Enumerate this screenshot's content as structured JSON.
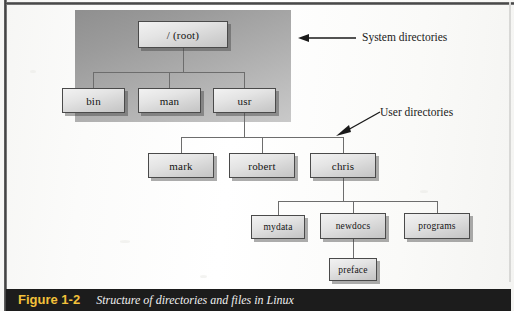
{
  "figure": {
    "number": "Figure 1-2",
    "caption": "Structure of directories and files in Linux"
  },
  "annotations": [
    {
      "id": "system-directories",
      "label": "System directories",
      "x": 362,
      "y": 36
    },
    {
      "id": "user-directories",
      "label": "User directories",
      "x": 380,
      "y": 113
    }
  ],
  "tree": {
    "title": "Structure of directories and files in Linux",
    "nodes": [
      {
        "id": "root",
        "label": "/ (root)",
        "x": 138,
        "y": 21,
        "w": 90,
        "h": 27,
        "level": 0,
        "zone": "system"
      },
      {
        "id": "bin",
        "label": "bin",
        "x": 62,
        "y": 88,
        "w": 63,
        "h": 25,
        "level": 1,
        "zone": "system"
      },
      {
        "id": "man",
        "label": "man",
        "x": 138,
        "y": 88,
        "w": 63,
        "h": 25,
        "level": 1,
        "zone": "system"
      },
      {
        "id": "usr",
        "label": "usr",
        "x": 213,
        "y": 88,
        "w": 63,
        "h": 25,
        "level": 1,
        "zone": "system"
      },
      {
        "id": "mark",
        "label": "mark",
        "x": 148,
        "y": 153,
        "w": 66,
        "h": 25,
        "level": 2,
        "zone": "user"
      },
      {
        "id": "robert",
        "label": "robert",
        "x": 229,
        "y": 153,
        "w": 66,
        "h": 25,
        "level": 2,
        "zone": "user"
      },
      {
        "id": "chris",
        "label": "chris",
        "x": 310,
        "y": 153,
        "w": 66,
        "h": 25,
        "level": 2,
        "zone": "user"
      },
      {
        "id": "mydata",
        "label": "mydata",
        "x": 251,
        "y": 215,
        "w": 54,
        "h": 24,
        "level": 3,
        "zone": "user"
      },
      {
        "id": "newdocs",
        "label": "newdocs",
        "x": 320,
        "y": 213,
        "w": 66,
        "h": 26,
        "level": 3,
        "zone": "user"
      },
      {
        "id": "programs",
        "label": "programs",
        "x": 404,
        "y": 213,
        "w": 66,
        "h": 26,
        "level": 3,
        "zone": "user"
      },
      {
        "id": "preface",
        "label": "preface",
        "x": 329,
        "y": 258,
        "w": 48,
        "h": 23,
        "level": 4,
        "zone": "user"
      }
    ],
    "edges": [
      {
        "from": "root",
        "to": "bin"
      },
      {
        "from": "root",
        "to": "man"
      },
      {
        "from": "root",
        "to": "usr"
      },
      {
        "from": "usr",
        "to": "mark"
      },
      {
        "from": "usr",
        "to": "robert"
      },
      {
        "from": "usr",
        "to": "chris"
      },
      {
        "from": "chris",
        "to": "mydata"
      },
      {
        "from": "chris",
        "to": "newdocs"
      },
      {
        "from": "chris",
        "to": "programs"
      },
      {
        "from": "newdocs",
        "to": "preface"
      }
    ]
  }
}
